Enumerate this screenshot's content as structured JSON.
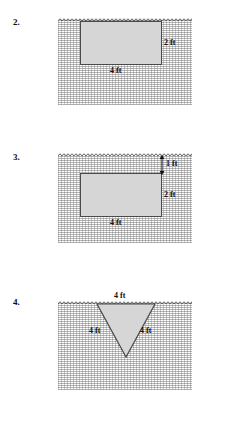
{
  "page": {
    "background": "#ffffff",
    "object_fill": "#d6d6d6",
    "object_stroke": "#4a4a4a",
    "hatch_color": "#787878"
  },
  "problems": [
    {
      "number": "2.",
      "shape": "rectangle",
      "labels": {
        "width": "4 ft",
        "height": "2 ft"
      },
      "notes": "rectangle fully submerged with top edge at the surface"
    },
    {
      "number": "3.",
      "shape": "rectangle",
      "labels": {
        "width": "4 ft",
        "height": "2 ft",
        "depth": "1 ft"
      },
      "notes": "rectangle submerged 1 ft below the surface"
    },
    {
      "number": "4.",
      "shape": "triangle",
      "labels": {
        "top": "4 ft",
        "left": "4 ft",
        "right": "4 ft"
      },
      "notes": "inverted equilateral triangle with top side at the surface"
    }
  ]
}
